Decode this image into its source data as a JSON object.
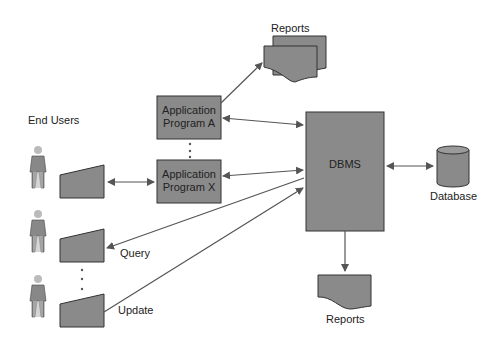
{
  "diagram": {
    "labels": {
      "end_users": "End Users",
      "reports_top": "Reports",
      "reports_bottom": "Reports",
      "database": "Database",
      "query": "Query",
      "update": "Update"
    },
    "boxes": {
      "app_a_line1": "Application",
      "app_a_line2": "Program A",
      "app_x_line1": "Application",
      "app_x_line2": "Program X",
      "dbms": "DBMS"
    },
    "colors": {
      "box_fill": "#8a8a8a",
      "stroke": "#333333",
      "arrow": "#555555"
    }
  }
}
